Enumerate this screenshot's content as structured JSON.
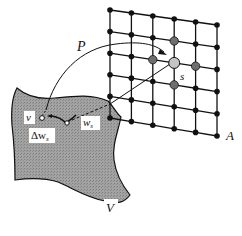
{
  "figure": {
    "type": "self-organizing map mapping diagram",
    "colors": {
      "background": "#ffffff",
      "sheet_fill": "#9a9a9a",
      "ink": "#111111",
      "winner_node": "#c4c4c4",
      "neighbor_node": "#6e6e6e",
      "plain_node": "#111111",
      "label_box": "#ffffff"
    }
  },
  "labels": {
    "mapping": "P",
    "winner": "s",
    "lattice": "A",
    "input_vector": "v",
    "weight_vector": "w",
    "weight_subscript": "s",
    "update_delta": "Δw",
    "update_subscript": "s",
    "input_space": "V"
  },
  "lattice": {
    "rows": 6,
    "cols": 6,
    "corners": {
      "top_left": [
        110,
        10
      ],
      "top_right": [
        217,
        25
      ],
      "bottom_left": [
        110,
        118
      ],
      "bottom_right": [
        217,
        136
      ]
    },
    "winner": {
      "row": 2,
      "col": 3
    },
    "neighbors": [
      {
        "row": 1,
        "col": 3
      },
      {
        "row": 2,
        "col": 2
      },
      {
        "row": 2,
        "col": 4
      },
      {
        "row": 3,
        "col": 3
      }
    ]
  },
  "points": {
    "v": [
      42,
      118
    ],
    "w_s": [
      67,
      123
    ]
  }
}
